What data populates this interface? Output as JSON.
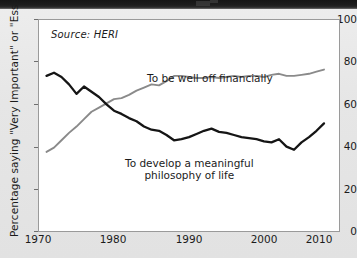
{
  "figure": {
    "source_note": "Source: HERI",
    "ylabel": "Percentage saying \"Very Important\" or \"Essential\"",
    "xlabel": "",
    "colors": {
      "wealth_line": "#8a8a8a",
      "philosophy_line": "#151515",
      "plot_background": "#ffffff",
      "page_background": "#e8e8e8"
    }
  },
  "axes": {
    "y_ticks": [
      "100",
      "80",
      "60",
      "40",
      "20",
      "0"
    ],
    "x_ticks": [
      "1970",
      "1980",
      "1990",
      "2000",
      "2010"
    ]
  },
  "labels": {
    "wealth": "To be well off financially",
    "philosophy_line1": "To develop a meaningful",
    "philosophy_line2": "philosophy of life"
  },
  "chart_data": {
    "type": "line",
    "title": "",
    "xlabel": "",
    "ylabel": "Percentage saying \"Very Important\" or \"Essential\"",
    "xlim": [
      1970,
      2010
    ],
    "ylim": [
      0,
      100
    ],
    "grid": false,
    "legend": "inline-annotations",
    "annotations": [
      {
        "text": "Source: HERI",
        "x": 1971.5,
        "y": 94
      },
      {
        "text": "To be well off financially",
        "x": 1991,
        "y": 81
      },
      {
        "text": "To develop a meaningful philosophy of life",
        "x": 1990,
        "y": 37
      }
    ],
    "x": [
      1971,
      1972,
      1973,
      1974,
      1975,
      1976,
      1977,
      1978,
      1979,
      1980,
      1981,
      1982,
      1983,
      1984,
      1985,
      1986,
      1987,
      1988,
      1989,
      1990,
      1991,
      1992,
      1993,
      1994,
      1995,
      1996,
      1997,
      1998,
      1999,
      2000,
      2001,
      2002,
      2003,
      2004,
      2005,
      2006,
      2007,
      2008
    ],
    "series": [
      {
        "name": "To develop a meaningful philosophy of life",
        "color": "#151515",
        "values": [
          73.5,
          75,
          73,
          69.5,
          65,
          68.5,
          66,
          63.5,
          60,
          57,
          55.5,
          53.5,
          52,
          49.5,
          48,
          47.5,
          45.5,
          43,
          43.5,
          44.5,
          46,
          47.5,
          48.5,
          47,
          46.5,
          45.5,
          44.5,
          44,
          43.5,
          42.5,
          42,
          43.5,
          40,
          38.5,
          42,
          44.5,
          47.5,
          51
        ]
      },
      {
        "name": "To be well off financially",
        "color": "#8a8a8a",
        "values": [
          37.5,
          39.5,
          43,
          46.5,
          49.5,
          53,
          56.5,
          58.5,
          60.5,
          62.5,
          63,
          64.5,
          66.5,
          68,
          69.5,
          69,
          71,
          73.5,
          73.5,
          73,
          72.5,
          72.5,
          73,
          72.5,
          73,
          73.5,
          73,
          73.5,
          73.5,
          73,
          74,
          74.5,
          73.5,
          73.5,
          74,
          74.5,
          75.5,
          76.5
        ]
      }
    ]
  }
}
